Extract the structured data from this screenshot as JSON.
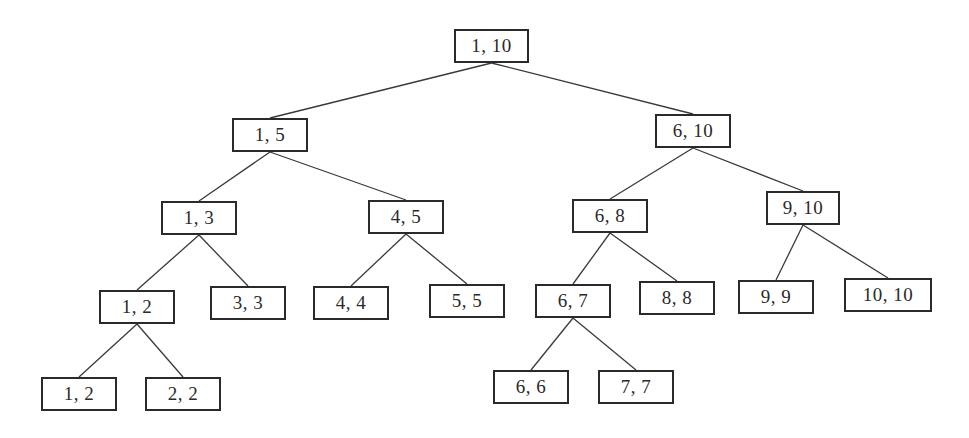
{
  "diagram": {
    "type": "segment-tree",
    "line_color": "#3a3a3a",
    "box_border_color": "#2a2a2a",
    "nodes": [
      {
        "id": "n1_10",
        "label": "1, 10",
        "x": 454,
        "y": 29,
        "w": 75,
        "h": 34
      },
      {
        "id": "n1_5",
        "label": "1, 5",
        "x": 232,
        "y": 118,
        "w": 76,
        "h": 34
      },
      {
        "id": "n6_10",
        "label": "6, 10",
        "x": 655,
        "y": 114,
        "w": 76,
        "h": 34
      },
      {
        "id": "n1_3",
        "label": "1, 3",
        "x": 161,
        "y": 201,
        "w": 76,
        "h": 34
      },
      {
        "id": "n4_5",
        "label": "4, 5",
        "x": 368,
        "y": 200,
        "w": 76,
        "h": 34
      },
      {
        "id": "n6_8",
        "label": "6, 8",
        "x": 572,
        "y": 199,
        "w": 76,
        "h": 34
      },
      {
        "id": "n9_10",
        "label": "9, 10",
        "x": 766,
        "y": 191,
        "w": 74,
        "h": 34
      },
      {
        "id": "n1_2",
        "label": "1, 2",
        "x": 99,
        "y": 290,
        "w": 76,
        "h": 34
      },
      {
        "id": "n3_3",
        "label": "3, 3",
        "x": 210,
        "y": 286,
        "w": 76,
        "h": 34
      },
      {
        "id": "n4_4",
        "label": "4, 4",
        "x": 313,
        "y": 286,
        "w": 76,
        "h": 34
      },
      {
        "id": "n5_5",
        "label": "5, 5",
        "x": 429,
        "y": 284,
        "w": 76,
        "h": 34
      },
      {
        "id": "n6_7",
        "label": "6, 7",
        "x": 535,
        "y": 284,
        "w": 76,
        "h": 34
      },
      {
        "id": "n8_8",
        "label": "8, 8",
        "x": 639,
        "y": 281,
        "w": 76,
        "h": 34
      },
      {
        "id": "n9_9",
        "label": "9, 9",
        "x": 738,
        "y": 280,
        "w": 76,
        "h": 34
      },
      {
        "id": "n10_10",
        "label": "10, 10",
        "x": 844,
        "y": 278,
        "w": 88,
        "h": 34
      },
      {
        "id": "n1_2b",
        "label": "1, 2",
        "x": 41,
        "y": 377,
        "w": 76,
        "h": 34
      },
      {
        "id": "n2_2",
        "label": "2, 2",
        "x": 145,
        "y": 377,
        "w": 76,
        "h": 34
      },
      {
        "id": "n6_6",
        "label": "6, 6",
        "x": 493,
        "y": 370,
        "w": 76,
        "h": 34
      },
      {
        "id": "n7_7",
        "label": "7, 7",
        "x": 598,
        "y": 370,
        "w": 76,
        "h": 34
      }
    ],
    "edges": [
      {
        "from": "n1_10",
        "to": "n1_5"
      },
      {
        "from": "n1_10",
        "to": "n6_10"
      },
      {
        "from": "n1_5",
        "to": "n1_3"
      },
      {
        "from": "n1_5",
        "to": "n4_5"
      },
      {
        "from": "n6_10",
        "to": "n6_8"
      },
      {
        "from": "n6_10",
        "to": "n9_10"
      },
      {
        "from": "n1_3",
        "to": "n1_2"
      },
      {
        "from": "n1_3",
        "to": "n3_3"
      },
      {
        "from": "n4_5",
        "to": "n4_4"
      },
      {
        "from": "n4_5",
        "to": "n5_5"
      },
      {
        "from": "n6_8",
        "to": "n6_7"
      },
      {
        "from": "n6_8",
        "to": "n8_8"
      },
      {
        "from": "n9_10",
        "to": "n9_9"
      },
      {
        "from": "n9_10",
        "to": "n10_10"
      },
      {
        "from": "n1_2",
        "to": "n1_2b"
      },
      {
        "from": "n1_2",
        "to": "n2_2"
      },
      {
        "from": "n6_7",
        "to": "n6_6"
      },
      {
        "from": "n6_7",
        "to": "n7_7"
      }
    ]
  }
}
